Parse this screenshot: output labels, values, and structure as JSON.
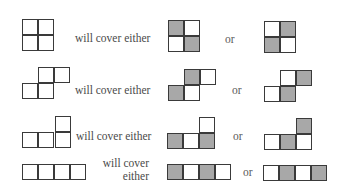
{
  "figure": {
    "rows": [
      {
        "id": "square",
        "label": "will cover either",
        "connector": "or",
        "shape": "2x2 square tetromino",
        "cells_left": [
          [
            0,
            0
          ],
          [
            1,
            0
          ],
          [
            0,
            1
          ],
          [
            1,
            1
          ]
        ],
        "pattern_a": [
          [
            0,
            0,
            "gray"
          ],
          [
            1,
            0,
            "white"
          ],
          [
            0,
            1,
            "white"
          ],
          [
            1,
            1,
            "gray"
          ]
        ],
        "pattern_b": [
          [
            0,
            0,
            "white"
          ],
          [
            1,
            0,
            "gray"
          ],
          [
            0,
            1,
            "gray"
          ],
          [
            1,
            1,
            "white"
          ]
        ]
      },
      {
        "id": "s-shape",
        "label": "will cover either",
        "connector": "or",
        "shape": "S tetromino",
        "pattern_a": [
          "top: gray, white",
          "bottom: gray, white"
        ],
        "pattern_b": [
          "top: white, gray",
          "bottom: white, gray"
        ]
      },
      {
        "id": "l-shape",
        "label": "will cover either",
        "connector": "or",
        "shape": "L tetromino",
        "pattern_a": [
          "top-right: white",
          "bottom: gray, white, gray"
        ],
        "pattern_b": [
          "top-right: gray",
          "bottom: white, gray, white"
        ]
      },
      {
        "id": "straight",
        "label_line1": "will cover",
        "label_line2": "either",
        "connector": "or",
        "shape": "I tetromino",
        "pattern_a": [
          "gray",
          "white",
          "gray",
          "white"
        ],
        "pattern_b": [
          "white",
          "gray",
          "white",
          "gray"
        ]
      }
    ],
    "colors": {
      "shaded": "#a8a8a8",
      "unshaded": "#ffffff",
      "outline": "#3a3a3a",
      "text": "#4a4a4a"
    }
  }
}
